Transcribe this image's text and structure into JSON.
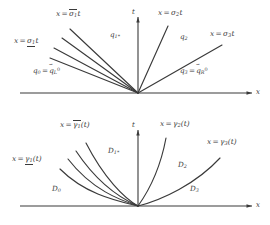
{
  "figure": {
    "stroke_color": "#3a3a3a",
    "background_color": "#ffffff"
  },
  "panels": [
    {
      "id": "top",
      "name": "straight-characteristic-panel",
      "axes": {
        "x_label": "x",
        "t_label": "t"
      },
      "curve_labels": [
        {
          "name": "sigma-1-bar-label",
          "x": "x",
          "rel": "=",
          "expr": "σ₁t",
          "overline": true,
          "text": "x = σ̅₁t"
        },
        {
          "name": "sigma-1-under-label",
          "x": "x",
          "rel": "=",
          "expr": "σ₁t",
          "underline": true,
          "text": "x = σ₁t"
        },
        {
          "name": "sigma-2-label",
          "x": "x",
          "rel": "=",
          "expr": "σ₂t",
          "text": "x = σ₂t"
        },
        {
          "name": "sigma-3-label",
          "x": "x",
          "rel": "=",
          "expr": "σ₃t",
          "text": "x = σ₃t"
        }
      ],
      "region_labels": [
        {
          "name": "region-q0",
          "text": "q₀ = q⃗ᴸ⁰"
        },
        {
          "name": "region-q1star",
          "text": "q₁*"
        },
        {
          "name": "region-q2",
          "text": "q₂"
        },
        {
          "name": "region-q3",
          "text": "q₃ = q⃗ᴿ⁰"
        }
      ]
    },
    {
      "id": "bottom",
      "name": "curved-characteristic-panel",
      "axes": {
        "x_label": "x",
        "t_label": "t"
      },
      "curve_labels": [
        {
          "name": "gamma-1-bar-label",
          "text": "x = γ̅₁(t)"
        },
        {
          "name": "gamma-1-under-label",
          "text": "x = γ₁(t)"
        },
        {
          "name": "gamma-2-label",
          "text": "x = γ₂(t)"
        },
        {
          "name": "gamma-3-label",
          "text": "x = γ₃(t)"
        }
      ],
      "region_labels": [
        {
          "name": "region-D0",
          "text": "D₀"
        },
        {
          "name": "region-D1star",
          "text": "D₁*"
        },
        {
          "name": "region-D2",
          "text": "D₂"
        },
        {
          "name": "region-D3",
          "text": "D₃"
        }
      ]
    }
  ],
  "text": {
    "x_axis": "x",
    "t_axis": "t",
    "var_x": "x",
    "equals": "=",
    "sigma": "σ",
    "gamma": "γ",
    "q": "q",
    "D": "D",
    "sub1": "1",
    "sub2": "2",
    "sub3": "3",
    "sub0": "0",
    "star": "*",
    "t": "t",
    "paren_t": "(t)",
    "supL": "L",
    "supR": "R",
    "sup0": "0"
  }
}
